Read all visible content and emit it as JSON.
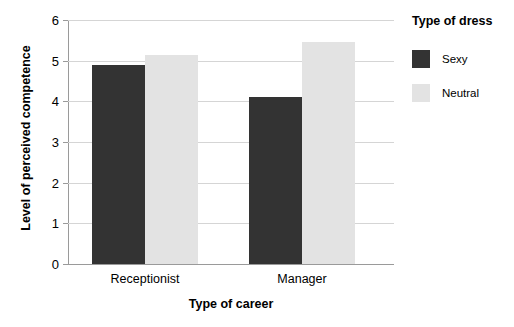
{
  "chart_data": {
    "type": "bar",
    "title": "",
    "xlabel": "Type of career",
    "ylabel": "Level of perceived competence",
    "categories": [
      "Receptionist",
      "Manager"
    ],
    "series": [
      {
        "name": "Sexy",
        "values": [
          4.9,
          4.1
        ],
        "color": "#333333"
      },
      {
        "name": "Neutral",
        "values": [
          5.15,
          5.45
        ],
        "color": "#E3E3E3"
      }
    ],
    "ylim": [
      0,
      6
    ],
    "yticks": [
      "0",
      "1",
      "2",
      "3",
      "4",
      "5",
      "6"
    ],
    "grid": true,
    "legend": {
      "title": "Type of dress",
      "position": "right",
      "entries": [
        {
          "label": "Sexy",
          "color": "#333333"
        },
        {
          "label": "Neutral",
          "color": "#E3E3E3"
        }
      ]
    },
    "colors": {
      "axis": "#9A9A9A",
      "grid": "#D5D5D5",
      "background": "#FFFFFF",
      "text": "#000000"
    }
  }
}
